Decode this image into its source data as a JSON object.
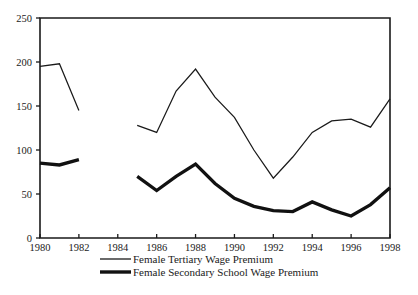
{
  "chart_data": {
    "type": "line",
    "title": "",
    "subtitle": "",
    "xlabel": "",
    "ylabel": "",
    "xlim": [
      1980,
      1998
    ],
    "ylim": [
      0,
      250
    ],
    "grid": false,
    "legend_position": "bottom-left",
    "y_ticks": [
      0,
      50,
      100,
      150,
      200,
      250
    ],
    "y_tick_labels": [
      "0",
      "50",
      "100",
      "150",
      "200",
      "250"
    ],
    "x_ticks": [
      1980,
      1982,
      1984,
      1986,
      1988,
      1990,
      1992,
      1994,
      1996,
      1998
    ],
    "x_tick_labels": [
      "1980",
      "1982",
      "1984",
      "1986",
      "1988",
      "1990",
      "1992",
      "1994",
      "1996",
      "1998"
    ],
    "series": [
      {
        "name": "Female Tertiary Wage Premium",
        "style": "thin",
        "x": [
          1980,
          1981,
          1982,
          1985,
          1986,
          1987,
          1988,
          1989,
          1990,
          1991,
          1992,
          1993,
          1994,
          1995,
          1996,
          1997,
          1998
        ],
        "values": [
          195,
          198,
          145,
          128,
          120,
          167,
          192,
          160,
          137,
          100,
          68,
          92,
          120,
          133,
          135,
          126,
          158
        ]
      },
      {
        "name": "Female Secondary School Wage Premium",
        "style": "thick",
        "x": [
          1980,
          1981,
          1982,
          1985,
          1986,
          1987,
          1988,
          1989,
          1990,
          1991,
          1992,
          1993,
          1994,
          1995,
          1996,
          1997,
          1998
        ],
        "values": [
          85,
          83,
          89,
          70,
          54,
          70,
          84,
          62,
          45,
          36,
          31,
          30,
          41,
          32,
          25,
          38,
          57
        ]
      }
    ]
  },
  "legend": {
    "entries": [
      {
        "label": "Female Tertiary Wage Premium"
      },
      {
        "label": "Female Secondary School Wage Premium"
      }
    ]
  },
  "colors": {
    "ink": "#1a1a1a",
    "background": "#ffffff"
  }
}
